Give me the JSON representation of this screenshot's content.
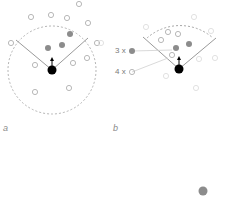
{
  "panels": [
    {
      "label": "a"
    },
    {
      "label": "b"
    }
  ],
  "legend": [
    {
      "count_label": "3 x",
      "kind": "filled"
    },
    {
      "count_label": "4 x",
      "kind": "hollow"
    }
  ],
  "colors": {
    "agent": "#000000",
    "filled_neighbor": "#8c8c8c",
    "hollow_neighbor": "#b8b8b8",
    "lines": "#a0a0a0"
  }
}
